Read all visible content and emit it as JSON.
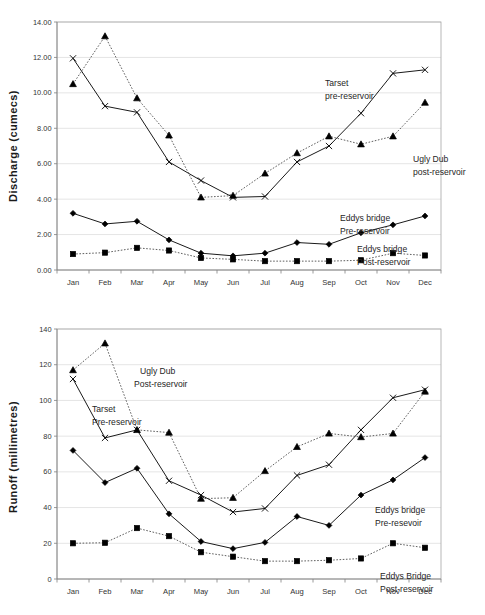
{
  "page": {
    "background": "#ffffff",
    "width": 485,
    "height": 615
  },
  "chart_data": [
    {
      "id": "discharge",
      "type": "line",
      "title": "",
      "xlabel": "",
      "ylabel": "Discharge (cumecs)",
      "ylim": [
        0,
        14
      ],
      "ytick_labels": [
        "0.00",
        "2.00",
        "4.00",
        "6.00",
        "8.00",
        "10.00",
        "12.00",
        "14.00"
      ],
      "ytick_values": [
        0,
        2,
        4,
        6,
        8,
        10,
        12,
        14
      ],
      "grid": true,
      "legend_position": "inline-annotations",
      "categories": [
        "Jan",
        "Feb",
        "Mar",
        "Apr",
        "May",
        "Jun",
        "Jul",
        "Aug",
        "Sep",
        "Oct",
        "Nov",
        "Dec"
      ],
      "series": [
        {
          "name": "Tarset pre-reservoir",
          "marker": "x",
          "line": "solid",
          "values": [
            11.95,
            9.25,
            8.9,
            6.1,
            5.05,
            4.1,
            4.15,
            6.1,
            7.0,
            8.85,
            11.1,
            11.3
          ]
        },
        {
          "name": "Ugly Dub post-reservoir",
          "marker": "triangle",
          "line": "dotted",
          "values": [
            10.5,
            13.2,
            9.7,
            7.6,
            4.1,
            4.2,
            5.45,
            6.6,
            7.55,
            7.1,
            7.55,
            9.45
          ]
        },
        {
          "name": "Eddys bridge Pre-reservoir",
          "marker": "diamond",
          "line": "solid",
          "values": [
            3.2,
            2.6,
            2.75,
            1.7,
            0.95,
            0.8,
            0.95,
            1.55,
            1.45,
            2.1,
            2.55,
            3.05
          ]
        },
        {
          "name": "Eddys bridge Post-reservoir",
          "marker": "square",
          "line": "dotted",
          "values": [
            0.9,
            0.98,
            1.25,
            1.1,
            0.68,
            0.6,
            0.5,
            0.5,
            0.5,
            0.55,
            0.95,
            0.82
          ]
        }
      ],
      "annotations": [
        {
          "id": "tarset",
          "lines": [
            "Tarset",
            "pre-reservoir"
          ]
        },
        {
          "id": "uglydub",
          "lines": [
            "Ugly Dub",
            "post-reservoir"
          ]
        },
        {
          "id": "eddys-pre",
          "lines": [
            "Eddys bridge",
            "Pre-reservoir"
          ]
        },
        {
          "id": "eddys-post",
          "lines": [
            "Eddys bridge",
            "Post-reservoir"
          ]
        }
      ]
    },
    {
      "id": "runoff",
      "type": "line",
      "title": "",
      "xlabel": "",
      "ylabel": "Runoff (millimetres)",
      "ylim": [
        0,
        140
      ],
      "ytick_labels": [
        "0",
        "20",
        "40",
        "60",
        "80",
        "100",
        "120",
        "140"
      ],
      "ytick_values": [
        0,
        20,
        40,
        60,
        80,
        100,
        120,
        140
      ],
      "grid": true,
      "legend_position": "inline-annotations",
      "categories": [
        "Jan",
        "Feb",
        "Mar",
        "Apr",
        "May",
        "Jun",
        "Jul",
        "Aug",
        "Sep",
        "Oct",
        "Nov",
        "Dec"
      ],
      "series": [
        {
          "name": "Tarset Pre-reservoir",
          "marker": "x",
          "line": "solid",
          "values": [
            112,
            79,
            83.5,
            55,
            47,
            37.5,
            39.5,
            58,
            64,
            83.5,
            101.5,
            106
          ]
        },
        {
          "name": "Ugly Dub Post-reservoir",
          "marker": "triangle",
          "line": "dotted",
          "values": [
            117,
            132,
            83.5,
            82,
            45,
            45.5,
            60.5,
            74,
            81.5,
            79.5,
            81.5,
            105
          ]
        },
        {
          "name": "Eddys bridge Pre-resevoir",
          "marker": "diamond",
          "line": "solid",
          "values": [
            72,
            54,
            62,
            36.5,
            21,
            17,
            20.5,
            35,
            30,
            47,
            55.5,
            68
          ]
        },
        {
          "name": "Eddys Bridge Post-reservoir",
          "marker": "square",
          "line": "dotted",
          "values": [
            20,
            20.3,
            28.5,
            24,
            15,
            12.5,
            10,
            10,
            10.5,
            11.5,
            20,
            17.5
          ]
        }
      ],
      "annotations": [
        {
          "id": "uglydub",
          "lines": [
            "Ugly Dub",
            "Post-reservoir"
          ]
        },
        {
          "id": "tarset",
          "lines": [
            "Tarset",
            "Pre-reservoir"
          ]
        },
        {
          "id": "eddys-pre",
          "lines": [
            "Eddys bridge",
            "Pre-resevoir"
          ]
        },
        {
          "id": "eddys-post",
          "lines": [
            "Eddys Bridge",
            "Post-reservoir"
          ]
        }
      ]
    }
  ]
}
